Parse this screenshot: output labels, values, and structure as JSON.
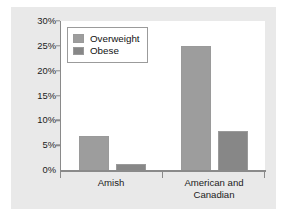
{
  "chart_data": {
    "type": "bar",
    "title": "",
    "subtitle": "",
    "xlabel": "",
    "ylabel": "",
    "categories": [
      "Amish",
      "American and Canadian"
    ],
    "category_lines": [
      [
        "Amish"
      ],
      [
        "American and",
        "Canadian"
      ]
    ],
    "series": [
      {
        "name": "Overweight",
        "values": [
          7,
          25
        ],
        "color": "#9d9d9d"
      },
      {
        "name": "Obese",
        "values": [
          1.5,
          8
        ],
        "color": "#878787"
      }
    ],
    "ylim": [
      0,
      30
    ],
    "ytick_values": [
      0,
      5,
      10,
      15,
      20,
      25,
      30
    ],
    "ytick_labels": [
      "0%",
      "5%",
      "10%",
      "15%",
      "20%",
      "25%",
      "30%"
    ],
    "grid": false,
    "legend_position": "upper-left",
    "legend_entries": [
      "Overweight",
      "Obese"
    ],
    "annotations": []
  },
  "colors": {
    "figure_background": "#e9e9e9",
    "plot_background": "#ffffff",
    "axis": "#8a8a8a",
    "text": "#1b1b1b",
    "legend_border": "#9b9b9b",
    "bar_border": "#9a9a9a"
  }
}
